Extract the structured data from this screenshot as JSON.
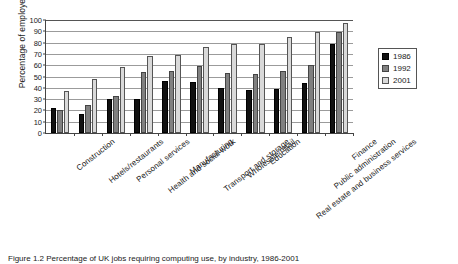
{
  "chart": {
    "ylabel": "Percentage of employees",
    "caption": "Figure 1.2 Percentage of UK jobs requiring computing use, by industry, 1986-2001"
  },
  "legend": {
    "position": "right",
    "items": [
      {
        "label": "1986",
        "color": "#111111"
      },
      {
        "label": "1992",
        "color": "#808080"
      },
      {
        "label": "2001",
        "color": "#d9d9d9"
      }
    ]
  },
  "chart_data": {
    "type": "bar",
    "title": "",
    "xlabel": "",
    "ylabel": "Percentage of employees",
    "ylim": [
      0,
      100
    ],
    "yticks": [
      0,
      10,
      20,
      30,
      40,
      50,
      60,
      70,
      80,
      90,
      100
    ],
    "grid": true,
    "legend_position": "right",
    "categories": [
      "Construction",
      "Hotels/restaurants",
      "Personal services",
      "Health and social work",
      "Manufacturing",
      "Transport and storage",
      "Wholesale/retail",
      "Education",
      "Real estate and business services",
      "Public administration",
      "Finance"
    ],
    "series": [
      {
        "name": "1986",
        "color": "#111111",
        "values": [
          22,
          17,
          30,
          30,
          46,
          45,
          40,
          38,
          39,
          44,
          79
        ]
      },
      {
        "name": "1992",
        "color": "#808080",
        "values": [
          20,
          25,
          33,
          54,
          55,
          59,
          53,
          52,
          55,
          60,
          89
        ]
      },
      {
        "name": "2001",
        "color": "#d9d9d9",
        "values": [
          37,
          48,
          58,
          68,
          69,
          76,
          79,
          79,
          85,
          89,
          97
        ]
      }
    ]
  }
}
